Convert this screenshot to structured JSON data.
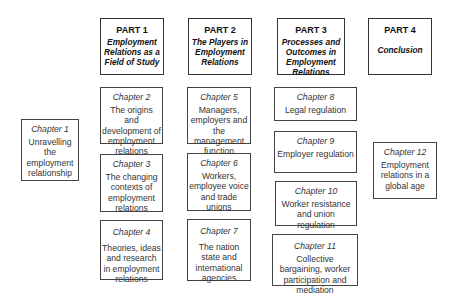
{
  "diagram": {
    "parts": [
      {
        "label": "PART 1",
        "title": "Employment Relations as a Field of Study"
      },
      {
        "label": "PART 2",
        "title": "The Players in Employment Relations"
      },
      {
        "label": "PART 3",
        "title": "Processes and Outcomes in Employment Relations"
      },
      {
        "label": "PART 4",
        "title": "Conclusion"
      }
    ],
    "chapters": [
      {
        "label": "Chapter 1",
        "title": "Unravelling the employment relationship"
      },
      {
        "label": "Chapter 2",
        "title": "The origins and development of employment relations"
      },
      {
        "label": "Chapter 3",
        "title": "The changing contexts of employment relations"
      },
      {
        "label": "Chapter 4",
        "title": "Theories, ideas and research in employment relations"
      },
      {
        "label": "Chapter 5",
        "title": "Managers, employers and the management function"
      },
      {
        "label": "Chapter 6",
        "title": "Workers, employee voice and trade unions"
      },
      {
        "label": "Chapter 7",
        "title": "The nation state and international agencies"
      },
      {
        "label": "Chapter 8",
        "title": "Legal regulation"
      },
      {
        "label": "Chapter 9",
        "title": "Employer regulation"
      },
      {
        "label": "Chapter 10",
        "title": "Worker resistance and union regulation"
      },
      {
        "label": "Chapter 11",
        "title": "Collective bargaining, worker participation and mediation"
      },
      {
        "label": "Chapter 12",
        "title": "Employment relations in a global age"
      }
    ]
  }
}
